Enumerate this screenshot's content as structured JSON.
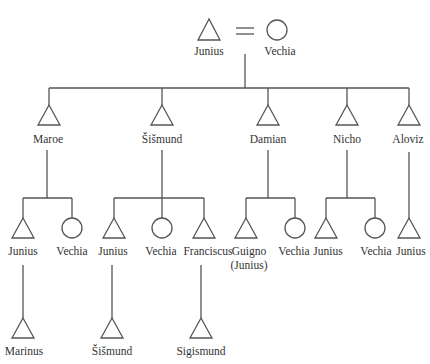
{
  "diagram": {
    "type": "kinship-genealogy",
    "line_color": "#555555",
    "symbols": {
      "male": "triangle",
      "female": "circle",
      "marriage": "equals-sign"
    },
    "generation_0": {
      "husband": {
        "name": "Junius",
        "sex": "male"
      },
      "wife": {
        "name": "Vechia",
        "sex": "female"
      }
    },
    "generation_1": [
      {
        "name": "Maroe",
        "sex": "male"
      },
      {
        "name": "Šišmund",
        "sex": "male"
      },
      {
        "name": "Damian",
        "sex": "male"
      },
      {
        "name": "Nicho",
        "sex": "male"
      },
      {
        "name": "Aloviz",
        "sex": "male"
      }
    ],
    "generation_2": [
      {
        "parent": "Maroe",
        "children": [
          {
            "name": "Junius",
            "sex": "male"
          },
          {
            "name": "Vechia",
            "sex": "female"
          }
        ]
      },
      {
        "parent": "Šišmund",
        "children": [
          {
            "name": "Junius",
            "sex": "male"
          },
          {
            "name": "Vechia",
            "sex": "female"
          },
          {
            "name": "Franciscus",
            "sex": "male"
          }
        ]
      },
      {
        "parent": "Damian",
        "children": [
          {
            "name": "Guigno",
            "alias": "(Junius)",
            "sex": "male"
          },
          {
            "name": "Vechia",
            "sex": "female"
          }
        ]
      },
      {
        "parent": "Nicho",
        "children": [
          {
            "name": "Junius",
            "sex": "male"
          },
          {
            "name": "Vechia",
            "sex": "female"
          }
        ]
      },
      {
        "parent": "Aloviz",
        "children": [
          {
            "name": "Junius",
            "sex": "male"
          }
        ]
      }
    ],
    "generation_3": [
      {
        "parent": "Junius (son of Maroe)",
        "name": "Marinus",
        "sex": "male"
      },
      {
        "parent": "Junius (son of Šišmund)",
        "name": "Šišmund",
        "sex": "male"
      },
      {
        "parent": "Franciscus",
        "name": "Sigismund",
        "sex": "male"
      }
    ]
  }
}
